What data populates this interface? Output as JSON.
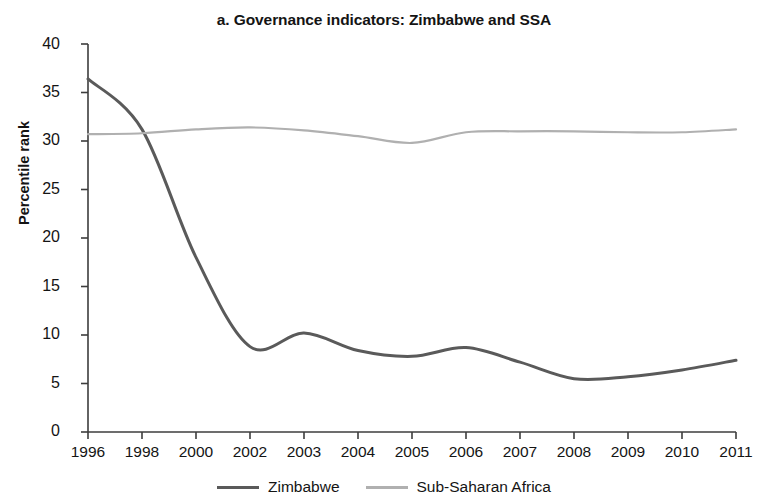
{
  "chart_data": {
    "type": "line",
    "title": "a. Governance indicators: Zimbabwe and SSA",
    "xlabel": "",
    "ylabel": "Percentile rank",
    "ylim": [
      0,
      40
    ],
    "ytick_labels": [
      "0",
      "5",
      "10",
      "15",
      "20",
      "25",
      "30",
      "35",
      "40"
    ],
    "ytick_values": [
      0,
      5,
      10,
      15,
      20,
      25,
      30,
      35,
      40
    ],
    "grid": false,
    "legend_position": "bottom-center",
    "categories": [
      "1996",
      "1998",
      "2000",
      "2002",
      "2003",
      "2004",
      "2005",
      "2006",
      "2007",
      "2008",
      "2009",
      "2010",
      "2011"
    ],
    "x": [
      1996,
      1998,
      2000,
      2002,
      2003,
      2004,
      2005,
      2006,
      2007,
      2008,
      2009,
      2010,
      2011
    ],
    "series": [
      {
        "name": "Zimbabwe",
        "color": "#5a5a5a",
        "width": 3.0,
        "values": [
          36.4,
          31.2,
          18.0,
          8.8,
          10.2,
          8.4,
          7.8,
          8.7,
          7.2,
          5.5,
          5.7,
          6.4,
          7.4
        ]
      },
      {
        "name": "Sub-Saharan Africa",
        "color": "#b0b0b0",
        "width": 2.2,
        "values": [
          30.7,
          30.8,
          31.2,
          31.4,
          31.1,
          30.5,
          29.8,
          30.9,
          31.0,
          31.0,
          30.9,
          30.9,
          31.2
        ]
      }
    ]
  },
  "legend": {
    "items": [
      {
        "label": "Zimbabwe",
        "color": "#5a5a5a"
      },
      {
        "label": "Sub-Saharan Africa",
        "color": "#b0b0b0"
      }
    ]
  },
  "axes": {
    "x_tick_labels": [
      "1996",
      "1998",
      "2000",
      "2002",
      "2003",
      "2004",
      "2005",
      "2006",
      "2007",
      "2008",
      "2009",
      "2010",
      "2011"
    ],
    "y_tick_labels": [
      "40",
      "35",
      "30",
      "25",
      "20",
      "15",
      "10",
      "5",
      "0"
    ]
  }
}
